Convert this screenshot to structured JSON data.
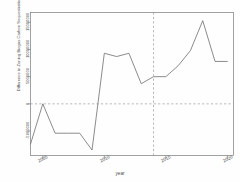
{
  "chart_data": {
    "type": "line",
    "title": "",
    "xlabel": "year",
    "ylabel": "Difference in Zoning Biogas Carbon Sequestration",
    "x": [
      2004,
      2005,
      2006,
      2007,
      2008,
      2009,
      2010,
      2011,
      2012,
      2013,
      2014,
      2015,
      2016,
      2017,
      2018,
      2019,
      2020
    ],
    "values": [
      -7400000,
      0,
      -5400000,
      -5400000,
      -5400000,
      -8500000,
      9300000,
      8700000,
      9300000,
      3700000,
      5000000,
      5000000,
      7000000,
      9800000,
      15300000,
      7800000,
      7800000
    ],
    "xlim": [
      2004,
      2020.5
    ],
    "ylim": [
      -9500000,
      16800000
    ],
    "xticks": [
      "2005",
      "2010",
      "2015",
      "2020"
    ],
    "xtick_values": [
      2005,
      2010,
      2015,
      2020
    ],
    "yticks": [
      "-5000000",
      "0",
      "5000000",
      "10000000",
      "15000000"
    ],
    "ytick_values": [
      -5000000,
      0,
      5000000,
      10000000,
      15000000
    ],
    "grid": false,
    "legend": null,
    "annotations": [
      {
        "name": "zero-reference-line",
        "type": "hline",
        "y": 0,
        "style": "dashed"
      },
      {
        "name": "intervention-line",
        "type": "vline",
        "x": 2014,
        "style": "dashed"
      }
    ],
    "series_color": "#6e6e6e",
    "reference_color": "#9a9a9a",
    "frame_color": "#7a7a7a"
  }
}
